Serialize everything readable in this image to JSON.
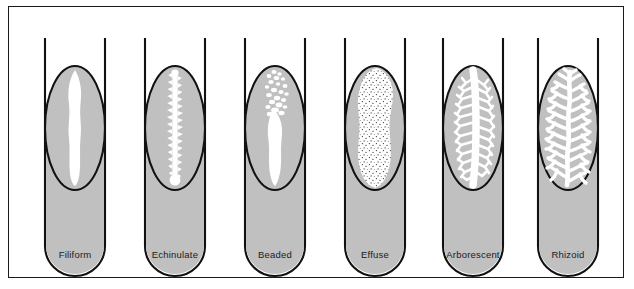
{
  "figure": {
    "background_color": "#ffffff",
    "frame_color": "#1a1a1a",
    "agar_color": "#c0c0c0",
    "growth_color": "#ffffff",
    "outline_color": "#111111"
  },
  "tubes": [
    {
      "id": "tube-filiform",
      "label": "Filiform",
      "pattern": "filiform",
      "description": "continuous uniform filament-like streak of growth along the stab line",
      "center_x": 75,
      "label_x": 75,
      "label_y": 249
    },
    {
      "id": "tube-echinulate",
      "label": "Echinulate",
      "pattern": "echinulate",
      "description": "streak with toothed or spiky jagged margins",
      "center_x": 175,
      "label_x": 175,
      "label_y": 249
    },
    {
      "id": "tube-beaded",
      "label": "Beaded",
      "pattern": "beaded",
      "description": "separate or semi-confluent colonies forming beads along the stab line",
      "center_x": 275,
      "label_x": 275,
      "label_y": 249
    },
    {
      "id": "tube-effuse",
      "label": "Effuse",
      "pattern": "effuse",
      "description": "growth spread out as a thin veil-like stippled layer over the slant",
      "center_x": 375,
      "label_x": 375,
      "label_y": 249
    },
    {
      "id": "tube-arborescent",
      "label": "Arborescent",
      "pattern": "arborescent",
      "description": "branched tree-like growth from a central trunk",
      "center_x": 473,
      "label_x": 473,
      "label_y": 249
    },
    {
      "id": "tube-rhizoid",
      "label": "Rhizoid",
      "pattern": "rhizoid",
      "description": "root-like irregular spreading branched growth",
      "center_x": 568,
      "label_x": 568,
      "label_y": 249
    }
  ]
}
